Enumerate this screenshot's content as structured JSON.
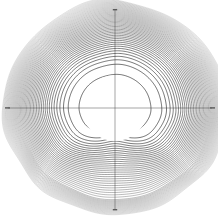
{
  "figure": {
    "title": "",
    "background_color": "#ffffff",
    "width": 218,
    "height": 219
  },
  "axes": {
    "center_x": 115,
    "center_y": 108,
    "x_axis_label": "x",
    "y_axis_label": "y",
    "x_axis_color": "#4a4a4a",
    "y_axis_color": "#4a4a4a",
    "x_min_marker": "−",
    "x_max_marker": "−",
    "y_max_marker": "−",
    "y_min_marker": "−",
    "x_extent_left": 8,
    "x_extent_right": 212,
    "y_extent_top": 10,
    "y_extent_bottom": 210
  },
  "chart_data": {
    "type": "line",
    "title": "",
    "subtitle": "",
    "xlabel": "x",
    "ylabel": "y",
    "grid": false,
    "legend": "none",
    "xlim": [
      -1.08,
      1.08
    ],
    "ylim": [
      -1.06,
      1.06
    ],
    "series_count": 46,
    "inner_circle": {
      "center": [
        0.0,
        0.0
      ],
      "radius_px": 33,
      "fill": "#ffffff",
      "label": "excluded-core"
    },
    "cusp_point": {
      "x": 0.02,
      "y": -0.33,
      "label": "cusp"
    },
    "radii_px": [
      34.0,
      34.8,
      35.7,
      36.7,
      37.8,
      39.0,
      40.3,
      41.7,
      43.2,
      44.8,
      46.5,
      48.3,
      50.2,
      52.2,
      54.3,
      56.5,
      58.8,
      61.2,
      63.7,
      66.3,
      69.0,
      71.8,
      74.6,
      77.5,
      80.4,
      83.3,
      86.2,
      89.0,
      91.7,
      94.2,
      96.6,
      98.8,
      100.8,
      102.5,
      104.0,
      105.2,
      106.2,
      107.0,
      107.6,
      108.0
    ],
    "series": [
      {
        "name": "contour-family",
        "stroke": "#000000",
        "count": 46,
        "kind": "closed-oval",
        "note": "each successive contour grows by a ratio near 1.03 close to the core and flattens at the outer edge"
      }
    ],
    "annotations": [
      {
        "text": "−",
        "x": -1.05,
        "y": 0.0,
        "role": "x-axis-left-cap"
      },
      {
        "text": "−",
        "x": 1.05,
        "y": 0.0,
        "role": "x-axis-right-cap"
      },
      {
        "text": "−",
        "x": 0.0,
        "y": 1.02,
        "role": "y-axis-top-cap"
      },
      {
        "text": "−",
        "x": 0.0,
        "y": -1.02,
        "role": "y-axis-bottom-cap"
      }
    ]
  }
}
